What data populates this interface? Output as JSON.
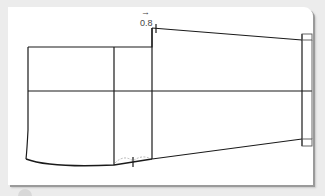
{
  "diagram": {
    "type": "sewing-pattern-sleeve",
    "annotation": {
      "label": "0.8",
      "arrow": "→"
    },
    "colors": {
      "line": "#1a1a1a",
      "guide": "#888888",
      "card": "#ffffff",
      "background": "#ececec"
    }
  }
}
